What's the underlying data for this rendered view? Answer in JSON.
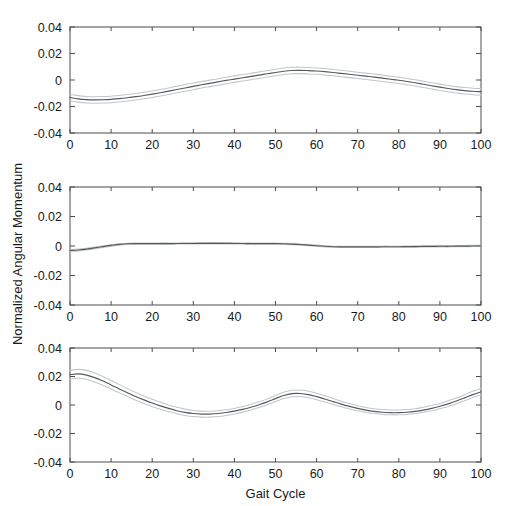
{
  "figure": {
    "ylabel": "Normalized Angular Momentum",
    "xlabel": "Gait Cycle",
    "background_color": "#ffffff",
    "mean_color": "#555a5e",
    "band_color": "#c2c6c9",
    "axis_color": "#4d4d4d"
  },
  "chart_data": [
    {
      "type": "line",
      "title": "",
      "subplot_index": 1,
      "xlabel": "",
      "ylabel": "Normalized Angular Momentum",
      "xlim": [
        0,
        100
      ],
      "ylim": [
        -0.04,
        0.04
      ],
      "xticks": [
        0,
        10,
        20,
        30,
        40,
        50,
        60,
        70,
        80,
        90,
        100
      ],
      "yticks": [
        -0.04,
        -0.02,
        0,
        0.02,
        0.04
      ],
      "xticklabels": [
        "0",
        "10",
        "20",
        "30",
        "40",
        "50",
        "60",
        "70",
        "80",
        "90",
        "100"
      ],
      "yticklabels": [
        "-0.04",
        "-0.02",
        "0",
        "0.02",
        "0.04"
      ],
      "grid": false,
      "legend": "none",
      "x": [
        0,
        2,
        4,
        6,
        8,
        10,
        12,
        14,
        16,
        18,
        20,
        22,
        24,
        26,
        28,
        30,
        32,
        34,
        36,
        38,
        40,
        42,
        44,
        46,
        48,
        50,
        52,
        54,
        56,
        58,
        60,
        62,
        64,
        66,
        68,
        70,
        72,
        74,
        76,
        78,
        80,
        82,
        84,
        86,
        88,
        90,
        92,
        94,
        96,
        98,
        100
      ],
      "series": [
        {
          "name": "mean",
          "values": [
            -0.0132,
            -0.0142,
            -0.0148,
            -0.015,
            -0.0149,
            -0.0146,
            -0.0141,
            -0.0134,
            -0.0126,
            -0.0117,
            -0.0107,
            -0.0096,
            -0.0084,
            -0.0072,
            -0.006,
            -0.0048,
            -0.0036,
            -0.0025,
            -0.0014,
            -0.0003,
            0.0007,
            0.0017,
            0.0027,
            0.0037,
            0.0047,
            0.0057,
            0.0066,
            0.0072,
            0.0073,
            0.0071,
            0.0068,
            0.0063,
            0.0057,
            0.005,
            0.0043,
            0.0036,
            0.0029,
            0.0022,
            0.0014,
            0.0006,
            -0.0002,
            -0.0011,
            -0.0021,
            -0.0032,
            -0.0043,
            -0.0054,
            -0.0064,
            -0.0073,
            -0.008,
            -0.0085,
            -0.0088
          ]
        },
        {
          "name": "upper",
          "values": [
            -0.0108,
            -0.0118,
            -0.0124,
            -0.0126,
            -0.0125,
            -0.0122,
            -0.0117,
            -0.011,
            -0.0102,
            -0.0093,
            -0.0083,
            -0.0072,
            -0.006,
            -0.0047,
            -0.0035,
            -0.0023,
            -0.0012,
            -0.0001,
            0.001,
            0.0021,
            0.0031,
            0.0041,
            0.0051,
            0.0061,
            0.0071,
            0.0081,
            0.009,
            0.0096,
            0.0097,
            0.0095,
            0.0091,
            0.0086,
            0.008,
            0.0073,
            0.0066,
            0.0059,
            0.0052,
            0.0045,
            0.0037,
            0.0029,
            0.0021,
            0.0012,
            0.0002,
            -0.0009,
            -0.002,
            -0.0031,
            -0.0041,
            -0.005,
            -0.0057,
            -0.0062,
            -0.0065
          ]
        },
        {
          "name": "lower",
          "values": [
            -0.0157,
            -0.0167,
            -0.0173,
            -0.0175,
            -0.0174,
            -0.0171,
            -0.0166,
            -0.0159,
            -0.0151,
            -0.0142,
            -0.0132,
            -0.0121,
            -0.0109,
            -0.0097,
            -0.0085,
            -0.0073,
            -0.0061,
            -0.005,
            -0.0039,
            -0.0028,
            -0.0018,
            -0.0008,
            0.0002,
            0.0012,
            0.0022,
            0.0032,
            0.0041,
            0.0047,
            0.0048,
            0.0046,
            0.0043,
            0.0038,
            0.0032,
            0.0025,
            0.0018,
            0.0011,
            0.0004,
            -0.0003,
            -0.0011,
            -0.0019,
            -0.0027,
            -0.0036,
            -0.0046,
            -0.0057,
            -0.0068,
            -0.0079,
            -0.0089,
            -0.0098,
            -0.0106,
            -0.0111,
            -0.0114
          ]
        }
      ]
    },
    {
      "type": "line",
      "title": "",
      "subplot_index": 2,
      "xlabel": "",
      "ylabel": "Normalized Angular Momentum",
      "xlim": [
        0,
        100
      ],
      "ylim": [
        -0.04,
        0.04
      ],
      "xticks": [
        0,
        10,
        20,
        30,
        40,
        50,
        60,
        70,
        80,
        90,
        100
      ],
      "yticks": [
        -0.04,
        -0.02,
        0,
        0.02,
        0.04
      ],
      "xticklabels": [
        "0",
        "10",
        "20",
        "30",
        "40",
        "50",
        "60",
        "70",
        "80",
        "90",
        "100"
      ],
      "yticklabels": [
        "-0.04",
        "-0.02",
        "0",
        "0.02",
        "0.04"
      ],
      "grid": false,
      "legend": "none",
      "x": [
        0,
        2,
        4,
        6,
        8,
        10,
        12,
        14,
        16,
        18,
        20,
        22,
        24,
        26,
        28,
        30,
        32,
        34,
        36,
        38,
        40,
        42,
        44,
        46,
        48,
        50,
        52,
        54,
        56,
        58,
        60,
        62,
        64,
        66,
        68,
        70,
        72,
        74,
        76,
        78,
        80,
        82,
        84,
        86,
        88,
        90,
        92,
        94,
        96,
        98,
        100
      ],
      "series": [
        {
          "name": "mean",
          "values": [
            -0.003,
            -0.0027,
            -0.0021,
            -0.0013,
            -0.0004,
            0.0004,
            0.0011,
            0.0015,
            0.0016,
            0.0016,
            0.0016,
            0.0016,
            0.0016,
            0.0017,
            0.0017,
            0.0017,
            0.0018,
            0.0018,
            0.0018,
            0.0018,
            0.0017,
            0.0017,
            0.0016,
            0.0016,
            0.0016,
            0.0016,
            0.0015,
            0.0013,
            0.001,
            0.0006,
            0.0002,
            -0.0002,
            -0.0005,
            -0.0006,
            -0.0006,
            -0.0006,
            -0.0006,
            -0.0006,
            -0.0005,
            -0.0005,
            -0.0005,
            -0.0004,
            -0.0004,
            -0.0003,
            -0.0003,
            -0.0002,
            -0.0002,
            -0.0001,
            -0.0001,
            0.0,
            0.0
          ]
        },
        {
          "name": "upper",
          "values": [
            -0.0024,
            -0.0021,
            -0.0015,
            -0.0007,
            0.0001,
            0.0009,
            0.0015,
            0.0019,
            0.002,
            0.002,
            0.002,
            0.0021,
            0.0021,
            0.0021,
            0.0022,
            0.0022,
            0.0022,
            0.0023,
            0.0023,
            0.0022,
            0.0022,
            0.0021,
            0.0021,
            0.002,
            0.002,
            0.002,
            0.0019,
            0.0017,
            0.0014,
            0.001,
            0.0006,
            0.0002,
            -0.0001,
            -0.0002,
            -0.0002,
            -0.0002,
            -0.0002,
            -0.0002,
            -0.0001,
            -0.0001,
            -0.0001,
            0.0,
            0.0001,
            0.0001,
            0.0002,
            0.0003,
            0.0003,
            0.0004,
            0.0004,
            0.0005,
            0.0005
          ]
        },
        {
          "name": "lower",
          "values": [
            -0.0036,
            -0.0033,
            -0.0027,
            -0.0019,
            -0.001,
            -0.0002,
            0.0006,
            0.0011,
            0.0012,
            0.0012,
            0.0012,
            0.0012,
            0.0012,
            0.0013,
            0.0013,
            0.0013,
            0.0014,
            0.0014,
            0.0014,
            0.0014,
            0.0013,
            0.0013,
            0.0012,
            0.0012,
            0.0012,
            0.0012,
            0.0011,
            0.0009,
            0.0006,
            0.0002,
            -0.0002,
            -0.0006,
            -0.0009,
            -0.001,
            -0.001,
            -0.001,
            -0.001,
            -0.001,
            -0.0009,
            -0.0009,
            -0.0009,
            -0.0008,
            -0.0008,
            -0.0007,
            -0.0007,
            -0.0006,
            -0.0006,
            -0.0005,
            -0.0005,
            -0.0004,
            -0.0004
          ]
        }
      ]
    },
    {
      "type": "line",
      "title": "",
      "subplot_index": 3,
      "xlabel": "Gait Cycle",
      "ylabel": "Normalized Angular Momentum",
      "xlim": [
        0,
        100
      ],
      "ylim": [
        -0.04,
        0.04
      ],
      "xticks": [
        0,
        10,
        20,
        30,
        40,
        50,
        60,
        70,
        80,
        90,
        100
      ],
      "yticks": [
        -0.04,
        -0.02,
        0,
        0.02,
        0.04
      ],
      "xticklabels": [
        "0",
        "10",
        "20",
        "30",
        "40",
        "50",
        "60",
        "70",
        "80",
        "90",
        "100"
      ],
      "yticklabels": [
        "-0.04",
        "-0.02",
        "0",
        "0.02",
        "0.04"
      ],
      "grid": false,
      "legend": "none",
      "x": [
        0,
        2,
        4,
        6,
        8,
        10,
        12,
        14,
        16,
        18,
        20,
        22,
        24,
        26,
        28,
        30,
        32,
        34,
        36,
        38,
        40,
        42,
        44,
        46,
        48,
        50,
        52,
        54,
        56,
        58,
        60,
        62,
        64,
        66,
        68,
        70,
        72,
        74,
        76,
        78,
        80,
        82,
        84,
        86,
        88,
        90,
        92,
        94,
        96,
        98,
        100
      ],
      "series": [
        {
          "name": "mean",
          "values": [
            0.0213,
            0.0218,
            0.021,
            0.0192,
            0.0168,
            0.0141,
            0.0113,
            0.0086,
            0.006,
            0.0036,
            0.0014,
            -0.0006,
            -0.0024,
            -0.004,
            -0.0052,
            -0.006,
            -0.0064,
            -0.0064,
            -0.006,
            -0.0053,
            -0.0043,
            -0.0031,
            -0.0016,
            0.0002,
            0.0022,
            0.0045,
            0.0067,
            0.008,
            0.0081,
            0.0073,
            0.0059,
            0.0042,
            0.0024,
            0.0006,
            -0.001,
            -0.0024,
            -0.0036,
            -0.0045,
            -0.0051,
            -0.0054,
            -0.0054,
            -0.0051,
            -0.0045,
            -0.0036,
            -0.0024,
            -0.0009,
            0.0008,
            0.0028,
            0.005,
            0.0073,
            0.0093
          ]
        },
        {
          "name": "upper",
          "values": [
            0.0243,
            0.025,
            0.0243,
            0.0225,
            0.02,
            0.0172,
            0.0143,
            0.0115,
            0.0088,
            0.0063,
            0.004,
            0.0019,
            0.0,
            -0.0016,
            -0.0029,
            -0.0038,
            -0.0043,
            -0.0044,
            -0.0041,
            -0.0034,
            -0.0024,
            -0.0011,
            0.0004,
            0.0022,
            0.0043,
            0.0066,
            0.0089,
            0.0103,
            0.0105,
            0.0097,
            0.0083,
            0.0065,
            0.0046,
            0.0027,
            0.001,
            -0.0005,
            -0.0017,
            -0.0026,
            -0.0032,
            -0.0035,
            -0.0035,
            -0.0032,
            -0.0026,
            -0.0016,
            -0.0004,
            0.0011,
            0.0029,
            0.0049,
            0.0072,
            0.0096,
            0.0117
          ]
        },
        {
          "name": "lower",
          "values": [
            0.0183,
            0.0188,
            0.018,
            0.0162,
            0.0138,
            0.0112,
            0.0085,
            0.0059,
            0.0034,
            0.0011,
            -0.001,
            -0.0029,
            -0.0046,
            -0.0061,
            -0.0073,
            -0.0081,
            -0.0085,
            -0.0085,
            -0.0081,
            -0.0073,
            -0.0063,
            -0.005,
            -0.0035,
            -0.0017,
            0.0002,
            0.0024,
            0.0045,
            0.0058,
            0.0059,
            0.0051,
            0.0037,
            0.0021,
            0.0004,
            -0.0013,
            -0.0028,
            -0.0041,
            -0.0052,
            -0.006,
            -0.0066,
            -0.0069,
            -0.0069,
            -0.0066,
            -0.006,
            -0.0051,
            -0.004,
            -0.0026,
            -0.001,
            0.0009,
            0.003,
            0.0052,
            0.0071
          ]
        }
      ]
    }
  ]
}
